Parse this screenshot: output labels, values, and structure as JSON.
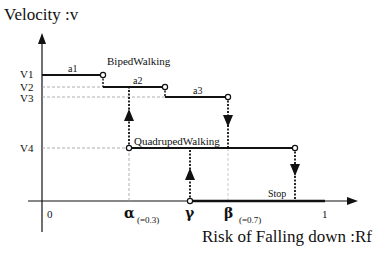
{
  "diagram": {
    "y_axis_title": "Velocity :v",
    "x_axis_title": "Risk of Falling down :Rf",
    "y_levels": [
      {
        "id": "V1",
        "label": "V1"
      },
      {
        "id": "V2",
        "label": "V2"
      },
      {
        "id": "V3",
        "label": "V3"
      },
      {
        "id": "V4",
        "label": "V4"
      }
    ],
    "x_ticks": [
      {
        "label": "0"
      },
      {
        "label": "α",
        "note": "(=0.3)"
      },
      {
        "label": "γ"
      },
      {
        "label": "β",
        "note": "(=0.7)"
      },
      {
        "label": "1"
      }
    ],
    "segments": [
      {
        "label": "a1",
        "level": "V1"
      },
      {
        "label": "a2",
        "level": "V2"
      },
      {
        "label": "a3",
        "level": "V3"
      }
    ],
    "modes": {
      "biped": "BipedWalking",
      "quadruped": "QuadrupedWalking",
      "stop": "Stop"
    },
    "colors": {
      "line": "#111111",
      "dashed": "#999999",
      "background": "#ffffff"
    }
  }
}
